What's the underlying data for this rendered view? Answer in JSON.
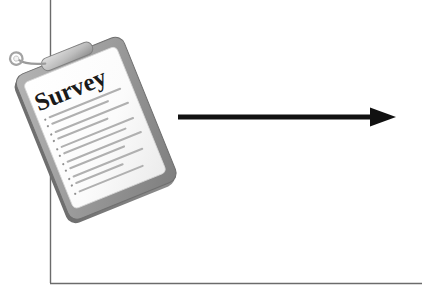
{
  "diagram": {
    "title_text": "Survey",
    "background_color": "#ffffff",
    "frame": {
      "name": "axis-frame",
      "line_color": "#6b6b6b",
      "vertical_x": 50,
      "vertical_top": 0,
      "vertical_bottom": 283,
      "horizontal_y": 283,
      "horizontal_left": 50,
      "horizontal_right": 422
    },
    "clipboard": {
      "name": "survey-clipboard",
      "board_color": "#9a9a9a",
      "board_edge_color": "#777777",
      "board_dark_color": "#6f6f6f",
      "paper_color": "#ffffff",
      "paper_line_color": "#b8b8b8",
      "shadow_color": "#d9d9d9",
      "clip_color": "#c9c9c9",
      "rotation_degrees": -22,
      "title": "Survey",
      "title_color": "#1a1a1a",
      "list_items": [
        "1.",
        "2.",
        "3.",
        "4.",
        "5.",
        "6.",
        "7.",
        "8.",
        "9."
      ],
      "line_count": 9
    },
    "arrow": {
      "name": "process-arrow",
      "color": "#111111",
      "direction": "right",
      "start_x": 178,
      "end_x": 396,
      "y": 117,
      "thickness": 5,
      "head_width": 26,
      "head_height": 19
    }
  }
}
